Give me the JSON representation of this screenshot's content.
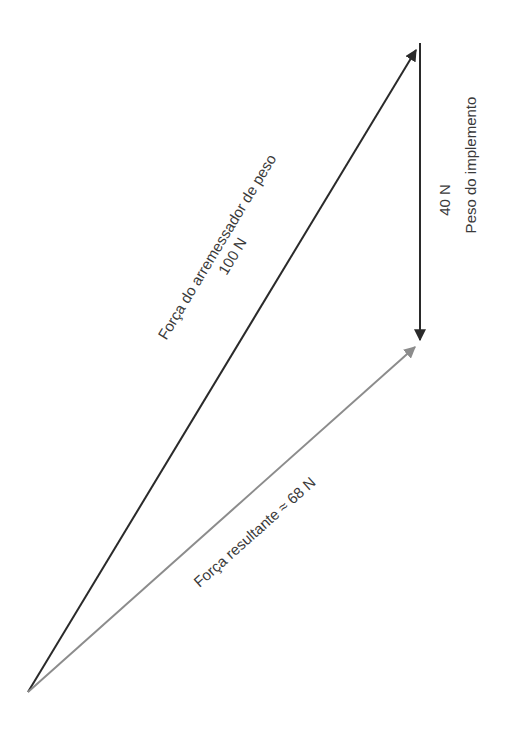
{
  "diagram": {
    "type": "vector-addition",
    "colors": {
      "thrower_force": "#2a2a2a",
      "weight": "#2a2a2a",
      "resultant": "#8c8c8c",
      "text": "#3a3a3a",
      "background": "#ffffff"
    },
    "vectors": [
      {
        "id": "thrower_force",
        "label": "Força do arremessador de peso",
        "magnitude_label": "100 N",
        "from": [
          28,
          692
        ],
        "to": [
          418,
          47
        ]
      },
      {
        "id": "weight",
        "label": "Peso do implemento",
        "magnitude_label": "40 N",
        "from": [
          420,
          43
        ],
        "to": [
          420,
          343
        ]
      },
      {
        "id": "resultant",
        "label": "Força resultante ≈ 68 N",
        "from": [
          28,
          692
        ],
        "to": [
          418,
          345
        ]
      }
    ]
  },
  "labels": {
    "thrower_name": "Força do arremessador de peso",
    "thrower_value": "100 N",
    "weight_value": "40 N",
    "weight_name": "Peso do implemento",
    "resultant": "Força resultante ≈ 68 N"
  }
}
